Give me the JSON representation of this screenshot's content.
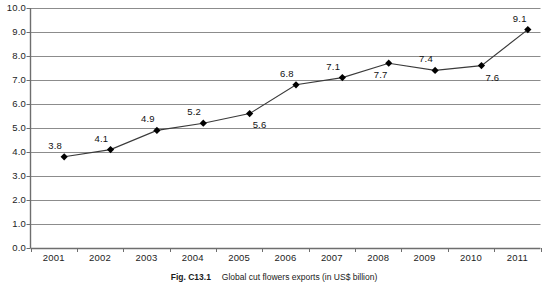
{
  "chart_data": {
    "type": "line",
    "title": "",
    "xlabel": "",
    "ylabel": "",
    "categories": [
      "2001",
      "2002",
      "2003",
      "2004",
      "2005",
      "2006",
      "2007",
      "2008",
      "2009",
      "2010",
      "2011"
    ],
    "values": [
      3.8,
      4.1,
      4.9,
      5.2,
      5.6,
      6.8,
      7.1,
      7.7,
      7.4,
      7.6,
      9.1
    ],
    "data_labels": [
      "3.8",
      "4.1",
      "4.9",
      "5.2",
      "5.6",
      "6.8",
      "7.1",
      "7.7",
      "7.4",
      "7.6",
      "9.1"
    ],
    "ylim": [
      0.0,
      10.0
    ],
    "ytick_labels": [
      "10.0",
      "9.0",
      "8.0",
      "7.0",
      "6.0",
      "5.0",
      "4.0",
      "3.0",
      "2.0",
      "1.0",
      "0.0"
    ],
    "ytick_values": [
      10.0,
      9.0,
      8.0,
      7.0,
      6.0,
      5.0,
      4.0,
      3.0,
      2.0,
      1.0,
      0.0
    ],
    "grid": "horizontal",
    "legend": "none",
    "marker": "diamond",
    "line_color": "#3a3a3a",
    "marker_color": "#000000",
    "grid_color": "#8c8c8c",
    "axis_color": "#6e6e6e"
  },
  "caption": {
    "figure_id": "Fig. C13.1",
    "text": "Global cut flowers exports (in US$ billion)"
  }
}
